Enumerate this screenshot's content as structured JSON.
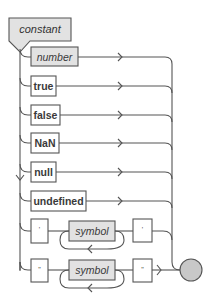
{
  "diagram": {
    "title": "constant",
    "colors": {
      "line": "#555555",
      "nonterminal_fill": "#e2e2e2",
      "terminal_fill": "#ffffff",
      "end_circle_fill": "#c8c8c8"
    },
    "alternatives": [
      {
        "type": "nonterminal",
        "label": "number"
      },
      {
        "type": "terminal",
        "label": "true"
      },
      {
        "type": "terminal",
        "label": "false"
      },
      {
        "type": "terminal",
        "label": "NaN"
      },
      {
        "type": "terminal",
        "label": "null"
      },
      {
        "type": "terminal",
        "label": "undefined"
      },
      {
        "type": "sequence",
        "open": "'",
        "repeat": {
          "type": "nonterminal",
          "label": "symbol"
        },
        "close": "'"
      },
      {
        "type": "sequence",
        "open": "\"",
        "repeat": {
          "type": "nonterminal",
          "label": "symbol"
        },
        "close": "\""
      }
    ],
    "end_marker": "end-circle"
  }
}
